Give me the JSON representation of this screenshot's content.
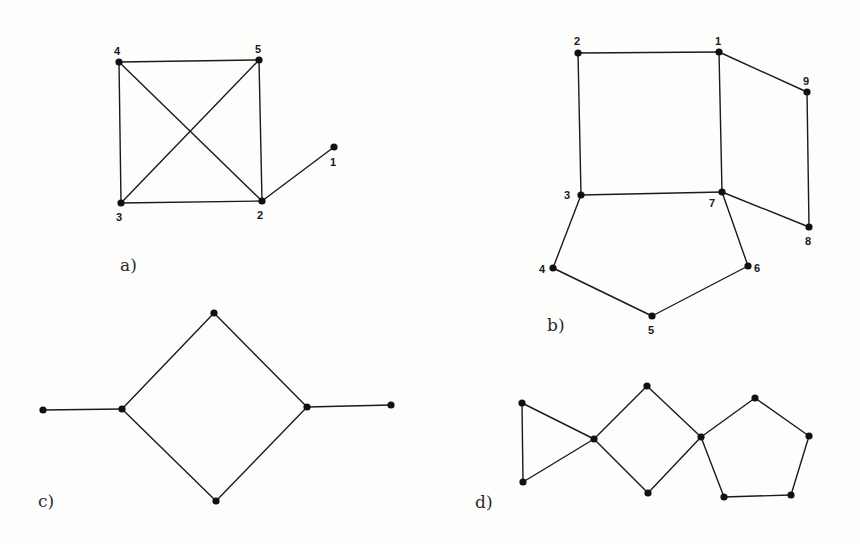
{
  "figure": {
    "graphs": [
      {
        "id": "a",
        "label": "a)",
        "label_pos": [
          120,
          271
        ],
        "nodes": [
          {
            "id": "1",
            "x": 334,
            "y": 147,
            "label": "1",
            "lx": 330,
            "ly": 166
          },
          {
            "id": "2",
            "x": 262,
            "y": 201,
            "label": "2",
            "lx": 257,
            "ly": 219
          },
          {
            "id": "3",
            "x": 121,
            "y": 203,
            "label": "3",
            "lx": 116,
            "ly": 221
          },
          {
            "id": "4",
            "x": 119,
            "y": 62,
            "label": "4",
            "lx": 114,
            "ly": 55
          },
          {
            "id": "5",
            "x": 259,
            "y": 60,
            "label": "5",
            "lx": 255,
            "ly": 53
          }
        ],
        "edges": [
          [
            "4",
            "5"
          ],
          [
            "4",
            "3"
          ],
          [
            "4",
            "2"
          ],
          [
            "5",
            "2"
          ],
          [
            "5",
            "3"
          ],
          [
            "3",
            "2"
          ],
          [
            "2",
            "1"
          ]
        ]
      },
      {
        "id": "b",
        "label": "b)",
        "label_pos": [
          547,
          331
        ],
        "nodes": [
          {
            "id": "1",
            "x": 719,
            "y": 52,
            "label": "1",
            "lx": 715,
            "ly": 45
          },
          {
            "id": "2",
            "x": 578,
            "y": 53,
            "label": "2",
            "lx": 574,
            "ly": 45
          },
          {
            "id": "3",
            "x": 581,
            "y": 195,
            "label": "3",
            "lx": 564,
            "ly": 199
          },
          {
            "id": "4",
            "x": 553,
            "y": 268,
            "label": "4",
            "lx": 539,
            "ly": 273
          },
          {
            "id": "5",
            "x": 652,
            "y": 316,
            "label": "5",
            "lx": 648,
            "ly": 334
          },
          {
            "id": "6",
            "x": 748,
            "y": 266,
            "label": "6",
            "lx": 754,
            "ly": 272
          },
          {
            "id": "7",
            "x": 722,
            "y": 192,
            "label": "7",
            "lx": 709,
            "ly": 207
          },
          {
            "id": "8",
            "x": 809,
            "y": 227,
            "label": "8",
            "lx": 805,
            "ly": 245
          },
          {
            "id": "9",
            "x": 807,
            "y": 92,
            "label": "9",
            "lx": 803,
            "ly": 85
          }
        ],
        "edges": [
          [
            "2",
            "1"
          ],
          [
            "2",
            "3"
          ],
          [
            "1",
            "7"
          ],
          [
            "1",
            "9"
          ],
          [
            "9",
            "8"
          ],
          [
            "7",
            "8"
          ],
          [
            "3",
            "7"
          ],
          [
            "3",
            "4"
          ],
          [
            "4",
            "5"
          ],
          [
            "5",
            "6"
          ],
          [
            "6",
            "7"
          ]
        ]
      },
      {
        "id": "c",
        "label": "c)",
        "label_pos": [
          38,
          507
        ],
        "nodes": [
          {
            "id": "c1",
            "x": 43,
            "y": 410
          },
          {
            "id": "c2",
            "x": 122,
            "y": 409
          },
          {
            "id": "c3",
            "x": 214,
            "y": 313
          },
          {
            "id": "c4",
            "x": 307,
            "y": 407
          },
          {
            "id": "c5",
            "x": 391,
            "y": 405
          },
          {
            "id": "c6",
            "x": 216,
            "y": 501
          }
        ],
        "edges": [
          [
            "c1",
            "c2"
          ],
          [
            "c2",
            "c3"
          ],
          [
            "c3",
            "c4"
          ],
          [
            "c4",
            "c6"
          ],
          [
            "c6",
            "c2"
          ],
          [
            "c4",
            "c5"
          ]
        ]
      },
      {
        "id": "d",
        "label": "d)",
        "label_pos": [
          475,
          508
        ],
        "nodes": [
          {
            "id": "d1",
            "x": 522,
            "y": 403
          },
          {
            "id": "d2",
            "x": 523,
            "y": 482
          },
          {
            "id": "d3",
            "x": 594,
            "y": 439
          },
          {
            "id": "d4",
            "x": 647,
            "y": 386
          },
          {
            "id": "d5",
            "x": 648,
            "y": 493
          },
          {
            "id": "d6",
            "x": 701,
            "y": 437
          },
          {
            "id": "d7",
            "x": 755,
            "y": 398
          },
          {
            "id": "d8",
            "x": 809,
            "y": 436
          },
          {
            "id": "d9",
            "x": 791,
            "y": 495
          },
          {
            "id": "d10",
            "x": 724,
            "y": 497
          }
        ],
        "edges": [
          [
            "d1",
            "d2"
          ],
          [
            "d1",
            "d3"
          ],
          [
            "d2",
            "d3"
          ],
          [
            "d3",
            "d4"
          ],
          [
            "d4",
            "d6"
          ],
          [
            "d6",
            "d5"
          ],
          [
            "d5",
            "d3"
          ],
          [
            "d6",
            "d7"
          ],
          [
            "d7",
            "d8"
          ],
          [
            "d8",
            "d9"
          ],
          [
            "d9",
            "d10"
          ],
          [
            "d10",
            "d6"
          ]
        ]
      }
    ]
  },
  "labels": {
    "a": "a)",
    "b": "b)",
    "c": "c)",
    "d": "d)"
  }
}
